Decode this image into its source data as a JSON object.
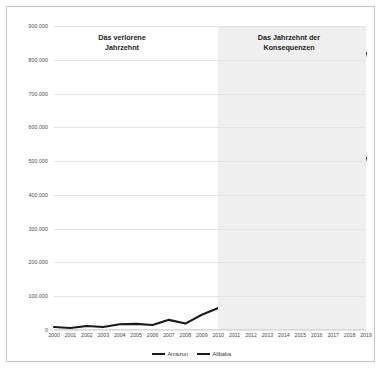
{
  "chart": {
    "type": "line",
    "title": "",
    "annotations": [
      {
        "name": "lost-decade",
        "text": "Das verlorene\nJahrzehnt"
      },
      {
        "name": "decade-of-consequences",
        "text": "Das Jahrzehnt der\nKonsequenzen"
      }
    ],
    "shaded_region": {
      "from": "2010",
      "to": "2019",
      "color": "#efefef"
    }
  },
  "chart_data": {
    "type": "line",
    "title": "",
    "xlabel": "",
    "ylabel": "",
    "ylim": [
      0,
      900000
    ],
    "ytick_step": 100000,
    "grid": true,
    "legend_position": "bottom",
    "categories": [
      "2000",
      "2001",
      "2002",
      "2003",
      "2004",
      "2005",
      "2006",
      "2007",
      "2008",
      "2009",
      "2010",
      "2011",
      "2012",
      "2013",
      "2014",
      "2015",
      "2016",
      "2017",
      "2018",
      "2019"
    ],
    "ytick_labels": [
      "0",
      "100.000",
      "200.000",
      "300.000",
      "400.000",
      "500.000",
      "600.000",
      "700.000",
      "800.000",
      "900.000"
    ],
    "series": [
      {
        "name": "Amazon",
        "color": "#1a1a1a",
        "values": [
          9000,
          6000,
          12000,
          9000,
          17000,
          18000,
          15000,
          30000,
          19000,
          45000,
          65000,
          66000,
          95000,
          130000,
          120000,
          300000,
          340000,
          370000,
          620000,
          820000
        ]
      },
      {
        "name": "Alibaba",
        "color": "#1a1a1a",
        "values": [
          null,
          null,
          null,
          null,
          null,
          null,
          null,
          null,
          null,
          null,
          null,
          null,
          null,
          null,
          220000,
          185000,
          205000,
          360000,
          315000,
          510000
        ]
      }
    ]
  },
  "legend": {
    "items": [
      {
        "label": "Amazon"
      },
      {
        "label": "Alibaba"
      }
    ]
  }
}
